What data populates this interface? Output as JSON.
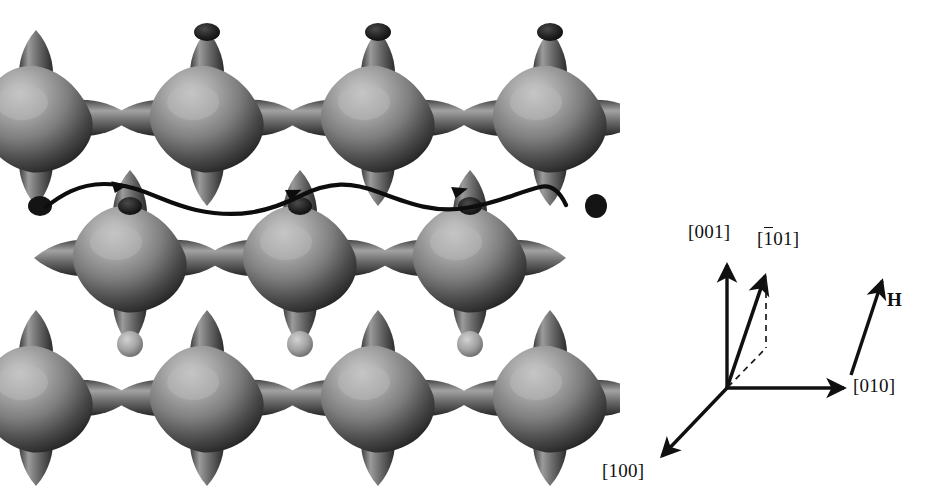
{
  "figure": {
    "background_color": "#ffffff",
    "ink_color": "#101010"
  },
  "fermi_surface": {
    "description": "Noble-metal Fermi surface repeated unit cells joined by necks, rendered in grayscale shading",
    "shading": {
      "highlight": "#c8c8c8",
      "midtone": "#8a8a8a",
      "shadow": "#3a3a3a",
      "deep_shadow": "#1e1e1e",
      "neck_cap": "#b8b8b8"
    },
    "lattice": {
      "columns": 3,
      "rows": 3,
      "spacing_x": 170,
      "spacing_y": 140,
      "row_offset_x": -38
    },
    "orbit": {
      "label": "open orbit trajectory",
      "color": "#0d0d0d",
      "stroke_width": 4,
      "arrow_count": 3,
      "path": "M 46,207 C 60,196 78,184 104,184 C 140,184 160,202 196,210 C 238,219 268,212 300,196 C 330,181 352,182 378,192 C 408,203 432,213 466,208 C 500,203 518,192 540,187 C 552,184 560,192 566,205",
      "arrow_positions": [
        {
          "x": 128,
          "y": 186,
          "angle": -8
        },
        {
          "x": 300,
          "y": 192,
          "angle": -18
        },
        {
          "x": 466,
          "y": 190,
          "angle": -12
        }
      ]
    }
  },
  "axes": {
    "origin": {
      "x": 127,
      "y": 173
    },
    "vectors": [
      {
        "name": "c-axis",
        "label": "[001]",
        "has_overbar": false,
        "tip": {
          "x": 127,
          "y": 47
        },
        "label_position": {
          "x": 95,
          "y": 14
        },
        "style": "solid"
      },
      {
        "name": "b-axis",
        "label": "[010]",
        "has_overbar": false,
        "tip": {
          "x": 247,
          "y": 173
        },
        "label_position": {
          "x": 254,
          "y": 160
        },
        "style": "solid"
      },
      {
        "name": "a-axis",
        "label": "[100]",
        "has_overbar": false,
        "tip": {
          "x": 59,
          "y": 244
        },
        "label_position": {
          "x": 5,
          "y": 248
        },
        "style": "solid"
      },
      {
        "name": "diagonal-direction",
        "label_prefix": "[",
        "label_overbar_char": "1",
        "label_suffix": "01]",
        "label": "[101]",
        "has_overbar": true,
        "tip": {
          "x": 166,
          "y": 58
        },
        "label_position": {
          "x": 160,
          "y": 22
        },
        "style": "solid"
      }
    ],
    "projection_lines": [
      {
        "name": "vertical-drop",
        "from": {
          "x": 166,
          "y": 62
        },
        "to": {
          "x": 166,
          "y": 133
        },
        "style": "dashed"
      },
      {
        "name": "in-plane-projection",
        "from": {
          "x": 127,
          "y": 173
        },
        "to": {
          "x": 166,
          "y": 133
        },
        "style": "dashed"
      }
    ],
    "field_vector": {
      "name": "magnetic-field",
      "label": "H",
      "tail": {
        "x": 251,
        "y": 160
      },
      "tip": {
        "x": 283,
        "y": 63
      },
      "label_position": {
        "x": 288,
        "y": 85
      },
      "style": "solid"
    }
  }
}
